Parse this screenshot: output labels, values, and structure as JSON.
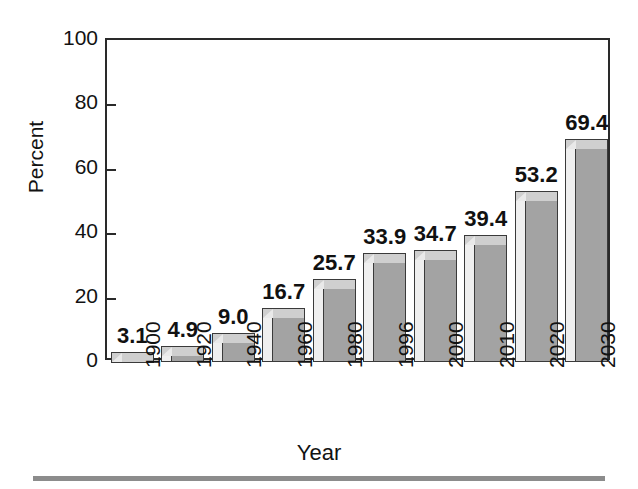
{
  "chart_data": {
    "type": "bar",
    "title": "",
    "xlabel": "Year",
    "ylabel": "Percent",
    "categories": [
      "1900",
      "1920",
      "1940",
      "1960",
      "1980",
      "1996",
      "2000",
      "2010",
      "2020",
      "2030"
    ],
    "values": [
      3.1,
      4.9,
      9.0,
      16.7,
      25.7,
      33.9,
      34.7,
      39.4,
      53.2,
      69.4
    ],
    "value_labels": [
      "3.1",
      "4.9",
      "9.0",
      "16.7",
      "25.7",
      "33.9",
      "34.7",
      "39.4",
      "53.2",
      "69.4"
    ],
    "ylim": [
      0,
      100
    ],
    "y_ticks": [
      0,
      20,
      40,
      60,
      80,
      100
    ],
    "y_tick_labels": [
      "0",
      "20",
      "40",
      "60",
      "80",
      "100"
    ],
    "grid": false,
    "legend": null,
    "series": [
      {
        "name": "Percent",
        "values": [
          3.1,
          4.9,
          9.0,
          16.7,
          25.7,
          33.9,
          34.7,
          39.4,
          53.2,
          69.4
        ]
      }
    ],
    "bar_color": "#a3a3a3",
    "axis_color": "#2a2a2a",
    "text_color": "#121212",
    "background": "#ffffff",
    "x_tick_rotation": -90
  },
  "axes": {
    "y_title": "Percent",
    "x_title": "Year"
  },
  "footer": {
    "rule_color": "#8c8c8c"
  }
}
